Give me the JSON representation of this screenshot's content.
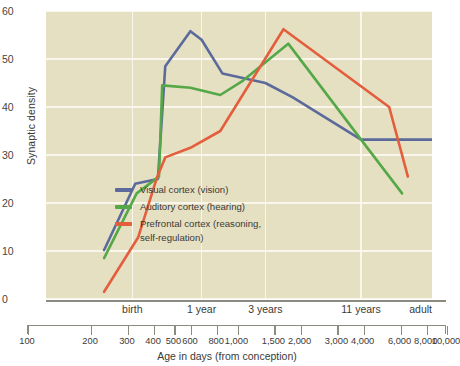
{
  "chart_data": {
    "type": "line",
    "title": "",
    "xlabel": "Age in days (from conception)",
    "ylabel": "Synaptic density",
    "xscale": "log",
    "xlim": [
      100,
      10000
    ],
    "ylim": [
      0,
      60
    ],
    "grid": true,
    "legend_position": "inside-center-left",
    "y_ticks": [
      0,
      10,
      20,
      30,
      40,
      50,
      60
    ],
    "x_ticks": [
      100,
      200,
      300,
      400,
      500,
      600,
      800,
      1000,
      1500,
      2000,
      3000,
      4000,
      6000,
      8000,
      10000
    ],
    "x_tick_labels": [
      "100",
      "200",
      "300",
      "400",
      "500",
      "600",
      "800",
      "1,000",
      "1,500",
      "2,000",
      "3,000",
      "4,000",
      "6,000",
      "8,000",
      "10,000"
    ],
    "stage_labels": [
      {
        "label": "birth",
        "x": 280
      },
      {
        "label": "1 year",
        "x": 640
      },
      {
        "label": "3 years",
        "x": 1370
      },
      {
        "label": "11 years",
        "x": 4290
      },
      {
        "label": "adult",
        "x": 10000
      }
    ],
    "gridlines_v": [
      280,
      640,
      1370,
      4290
    ],
    "series": [
      {
        "name": "Visual cortex (vision)",
        "color": "#5b6a9b",
        "points": [
          {
            "x": 200,
            "y": 10.2
          },
          {
            "x": 290,
            "y": 24.0
          },
          {
            "x": 380,
            "y": 25.0
          },
          {
            "x": 415,
            "y": 48.5
          },
          {
            "x": 560,
            "y": 55.8
          },
          {
            "x": 640,
            "y": 54.0
          },
          {
            "x": 820,
            "y": 47.0
          },
          {
            "x": 1370,
            "y": 45.0
          },
          {
            "x": 1900,
            "y": 42.0
          },
          {
            "x": 4290,
            "y": 33.2
          },
          {
            "x": 10000,
            "y": 33.2
          }
        ]
      },
      {
        "name": "Auditory cortex (hearing)",
        "color": "#55a847",
        "points": [
          {
            "x": 200,
            "y": 8.5
          },
          {
            "x": 295,
            "y": 22.0
          },
          {
            "x": 385,
            "y": 25.5
          },
          {
            "x": 400,
            "y": 44.5
          },
          {
            "x": 560,
            "y": 44.0
          },
          {
            "x": 800,
            "y": 42.5
          },
          {
            "x": 1050,
            "y": 45.5
          },
          {
            "x": 1800,
            "y": 53.2
          },
          {
            "x": 4290,
            "y": 33.2
          },
          {
            "x": 7000,
            "y": 22.0
          }
        ]
      },
      {
        "name": "Prefrontal cortex (reasoning,\nself-regulation)",
        "color": "#e35e3d",
        "points": [
          {
            "x": 200,
            "y": 1.5
          },
          {
            "x": 300,
            "y": 12.8
          },
          {
            "x": 375,
            "y": 25.2
          },
          {
            "x": 415,
            "y": 29.5
          },
          {
            "x": 560,
            "y": 31.5
          },
          {
            "x": 800,
            "y": 35.0
          },
          {
            "x": 1700,
            "y": 56.2
          },
          {
            "x": 6000,
            "y": 40.0
          },
          {
            "x": 7500,
            "y": 25.5
          }
        ]
      }
    ]
  },
  "legend": {
    "items": [
      {
        "label": "Visual cortex (vision)",
        "color": "#5b6a9b"
      },
      {
        "label": "Auditory cortex (hearing)",
        "color": "#55a847"
      },
      {
        "label": "Prefrontal cortex (reasoning,\nself-regulation)",
        "color": "#e35e3d"
      }
    ]
  },
  "colors": {
    "plot_background": "#e6e0c3",
    "gridline": "#fbf8ef",
    "axis": "#8d8b80",
    "text": "#3b3a36",
    "page_background": "#ffffff"
  }
}
